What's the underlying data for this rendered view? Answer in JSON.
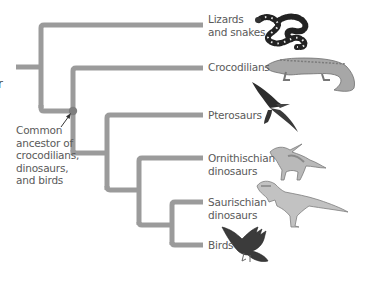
{
  "diagram": {
    "type": "phylogenetic-tree",
    "branch_color": "#9b9b9b",
    "node_color": "#7f7f7f",
    "text_color": "#5a5a5a",
    "taxa": [
      {
        "id": "lizards",
        "label": "Lizards\nand snakes",
        "image": "coral-snake"
      },
      {
        "id": "crocodilians",
        "label": "Crocodilians",
        "image": "crocodile"
      },
      {
        "id": "pterosaurs",
        "label": "Pterosaurs",
        "image": "pterosaur"
      },
      {
        "id": "ornithischian",
        "label": "Ornithischian\ndinosaurs",
        "image": "parasaurolophus"
      },
      {
        "id": "saurischian",
        "label": "Saurischian\ndinosaurs",
        "image": "theropod"
      },
      {
        "id": "birds",
        "label": "Birds",
        "image": "bird"
      }
    ],
    "annotation": {
      "label": "Common\nancestor of\ncrocodilians,\ndinosaurs,\nand birds",
      "points_to": "archosaur-node"
    },
    "cut_off_fragment": "r"
  }
}
